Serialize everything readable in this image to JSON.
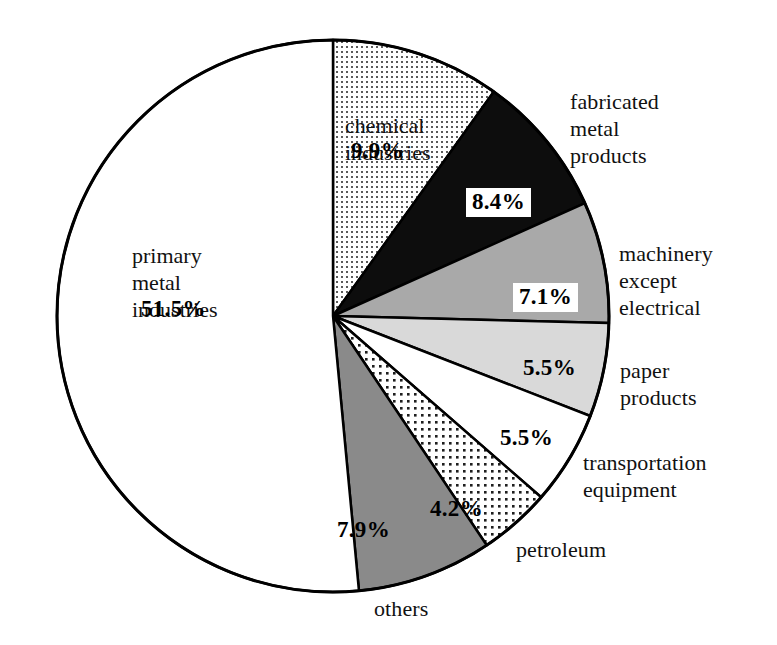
{
  "chart_data": {
    "type": "pie",
    "title": "",
    "subtitle": "",
    "xlabel": "",
    "ylabel": "",
    "legend_position": "none",
    "grid": false,
    "units": "percent",
    "total": 100.0,
    "start_angle_deg": 0,
    "direction": "clockwise",
    "categories": [
      "chemical industries",
      "fabricated metal products",
      "machinery except electrical",
      "paper products",
      "transportation equipment",
      "petroleum",
      "others",
      "primary metal industries"
    ],
    "values": [
      9.9,
      8.4,
      7.1,
      5.5,
      5.5,
      4.2,
      7.9,
      51.5
    ],
    "slices": [
      {
        "label": "chemical industries",
        "label_text": "chemical\nindustries",
        "value": 9.9,
        "value_text": "9.9%",
        "fill": "fine-dots",
        "fill_color": "#ffffff",
        "dot_color": "#4a4a4a",
        "label_placement": "inside",
        "boxed_value": false
      },
      {
        "label": "fabricated metal products",
        "label_text": "fabricated\nmetal\nproducts",
        "value": 8.4,
        "value_text": "8.4%",
        "fill": "solid",
        "fill_color": "#0d0d0d",
        "dot_color": "",
        "label_placement": "outside",
        "boxed_value": true
      },
      {
        "label": "machinery except electrical",
        "label_text": "machinery\nexcept\nelectrical",
        "value": 7.1,
        "value_text": "7.1%",
        "fill": "solid",
        "fill_color": "#a9a9a9",
        "dot_color": "",
        "label_placement": "outside",
        "boxed_value": true
      },
      {
        "label": "paper products",
        "label_text": "paper\nproducts",
        "value": 5.5,
        "value_text": "5.5%",
        "fill": "solid",
        "fill_color": "#d9d9d9",
        "dot_color": "",
        "label_placement": "outside",
        "boxed_value": false
      },
      {
        "label": "transportation equipment",
        "label_text": "transportation\nequipment",
        "value": 5.5,
        "value_text": "5.5%",
        "fill": "solid",
        "fill_color": "#ffffff",
        "dot_color": "",
        "label_placement": "outside",
        "boxed_value": false
      },
      {
        "label": "petroleum",
        "label_text": "petroleum",
        "value": 4.2,
        "value_text": "4.2%",
        "fill": "coarse-dots",
        "fill_color": "#ffffff",
        "dot_color": "#1a1a1a",
        "label_placement": "outside",
        "boxed_value": false
      },
      {
        "label": "others",
        "label_text": "others",
        "value": 7.9,
        "value_text": "7.9%",
        "fill": "solid",
        "fill_color": "#8a8a8a",
        "dot_color": "",
        "label_placement": "outside",
        "boxed_value": false
      },
      {
        "label": "primary metal industries",
        "label_text": "primary\nmetal\nindustries",
        "value": 51.5,
        "value_text": "51.5%",
        "fill": "solid",
        "fill_color": "#ffffff",
        "dot_color": "",
        "label_placement": "inside",
        "boxed_value": false
      }
    ],
    "colors": {
      "outline": "#000000",
      "background": "#ffffff",
      "text": "#111111"
    }
  },
  "labels": {
    "chemical_industries": "chemical\nindustries",
    "chemical_industries_pct": "9.9%",
    "fabricated_metal_products": "fabricated\nmetal\nproducts",
    "fabricated_metal_products_pct": "8.4%",
    "machinery_except_electrical": "machinery\nexcept\nelectrical",
    "machinery_except_electrical_pct": "7.1%",
    "paper_products": "paper\nproducts",
    "paper_products_pct": "5.5%",
    "transportation_equipment": "transportation\nequipment",
    "transportation_equipment_pct": "5.5%",
    "petroleum": "petroleum",
    "petroleum_pct": "4.2%",
    "others": "others",
    "others_pct": "7.9%",
    "primary_metal_industries": "primary\nmetal\nindustries",
    "primary_metal_industries_pct": "51.5%"
  }
}
